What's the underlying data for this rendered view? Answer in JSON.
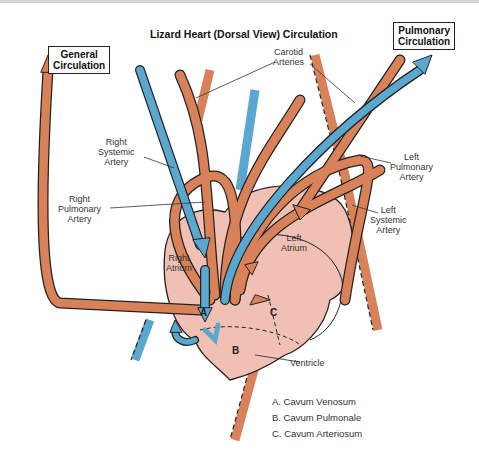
{
  "title": "Lizard Heart (Dorsal View) Circulation",
  "boxes": {
    "general": [
      "General",
      "Circulation"
    ],
    "pulmonary": [
      "Pulmonary",
      "Circulation"
    ]
  },
  "labels": {
    "carotid": [
      "Carotid",
      "Arteries"
    ],
    "right_systemic": [
      "Right",
      "Systemic",
      "Artery"
    ],
    "right_pulmonary": [
      "Right",
      "Pulmonary",
      "Artery"
    ],
    "left_pulmonary": [
      "Left",
      "Pulmonary",
      "Artery"
    ],
    "left_systemic": [
      "Left",
      "Systemic",
      "Artery"
    ],
    "right_atrium": [
      "Right",
      "Atrium"
    ],
    "left_atrium": [
      "Left",
      "Atrium"
    ],
    "ventricle": "Ventricle"
  },
  "chambers": {
    "a": "A",
    "b": "B",
    "c": "C"
  },
  "legend": [
    "A. Cavum Venosum",
    "B. Cavum Pulmonale",
    "C. Cavum Arteriosum"
  ],
  "colors": {
    "artery": "#d9825a",
    "vein": "#5aa8d0",
    "heart": "#f0c0b4",
    "outline": "#222222"
  }
}
